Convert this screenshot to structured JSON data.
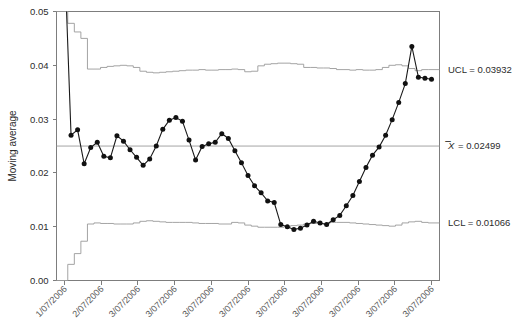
{
  "chart_data": {
    "type": "line",
    "title": "",
    "xlabel": "",
    "ylabel": "Moving average",
    "ylim": [
      0.0,
      0.05
    ],
    "yticks": [
      0.0,
      0.01,
      0.02,
      0.03,
      0.04,
      0.05
    ],
    "ytick_labels": [
      "0.00",
      "0.01",
      "0.02",
      "0.03",
      "0.04",
      "0.05"
    ],
    "grid": false,
    "legend_position": "right-annotations",
    "xtick_labels": [
      "1/07/2006",
      "2/07/2006",
      "3/07/2006",
      "3/07/2006",
      "3/07/2006",
      "3/07/2006",
      "3/07/2006",
      "3/07/2006",
      "3/07/2006",
      "3/07/2006",
      "3/07/2006"
    ],
    "annotations": [
      {
        "name": "ucl",
        "text": "UCL = 0.03932",
        "value": 0.03932
      },
      {
        "name": "centerline",
        "text": "= 0.02499",
        "symbol": "X",
        "value": 0.02499
      },
      {
        "name": "lcl",
        "text": "LCL = 0.01066",
        "value": 0.01066
      }
    ],
    "series": [
      {
        "name": "Moving average",
        "values": [
          0.0605,
          0.027,
          0.028,
          0.0217,
          0.0247,
          0.0257,
          0.0231,
          0.0228,
          0.0269,
          0.0259,
          0.0243,
          0.0229,
          0.0214,
          0.0226,
          0.025,
          0.0281,
          0.0298,
          0.0303,
          0.0296,
          0.0261,
          0.0224,
          0.0249,
          0.0254,
          0.0257,
          0.0273,
          0.0264,
          0.0241,
          0.0219,
          0.0195,
          0.0176,
          0.0163,
          0.0148,
          0.0145,
          0.0104,
          0.01,
          0.0095,
          0.0097,
          0.0103,
          0.011,
          0.0107,
          0.0104,
          0.0113,
          0.0121,
          0.0139,
          0.0158,
          0.0184,
          0.021,
          0.0233,
          0.0248,
          0.027,
          0.0299,
          0.0331,
          0.0366,
          0.0435,
          0.0378,
          0.0376,
          0.0374
        ]
      }
    ],
    "ucl_steps": [
      0.05,
      0.0478,
      0.0462,
      0.045,
      0.0393,
      0.0393,
      0.0396,
      0.0398,
      0.0399,
      0.04,
      0.0399,
      0.0396,
      0.0389,
      0.0387,
      0.0386,
      0.0387,
      0.0388,
      0.0389,
      0.039,
      0.0391,
      0.0391,
      0.0392,
      0.0391,
      0.0391,
      0.0392,
      0.0392,
      0.0393,
      0.0392,
      0.0388,
      0.0389,
      0.0399,
      0.0402,
      0.0403,
      0.0404,
      0.0404,
      0.0403,
      0.0402,
      0.0396,
      0.0396,
      0.0395,
      0.0395,
      0.0394,
      0.0392,
      0.0392,
      0.0391,
      0.0392,
      0.0391,
      0.0391,
      0.0392,
      0.0396,
      0.04,
      0.0401,
      0.0399,
      0.0394,
      0.039,
      0.0392,
      0.0392
    ],
    "lcl_steps": [
      0.0,
      0.003,
      0.005,
      0.0073,
      0.0105,
      0.0107,
      0.0106,
      0.0106,
      0.0105,
      0.0105,
      0.0105,
      0.0107,
      0.011,
      0.0111,
      0.011,
      0.0109,
      0.0108,
      0.0108,
      0.0108,
      0.0108,
      0.0107,
      0.0106,
      0.0106,
      0.0106,
      0.0105,
      0.0105,
      0.0108,
      0.0107,
      0.0103,
      0.0101,
      0.0099,
      0.0099,
      0.0099,
      0.0099,
      0.01,
      0.0102,
      0.0103,
      0.0105,
      0.0106,
      0.0106,
      0.0106,
      0.0108,
      0.0108,
      0.0108,
      0.0107,
      0.0106,
      0.0105,
      0.0104,
      0.0103,
      0.0102,
      0.0101,
      0.0103,
      0.0107,
      0.0109,
      0.011,
      0.0108,
      0.0107
    ],
    "centerline_value": 0.02499,
    "colors": {
      "series": "#111111",
      "limits": "#9a9a9a",
      "frame": "#7d7d7d",
      "text": "#2b2b2b",
      "xtick_text": "#5a5a5a"
    }
  }
}
